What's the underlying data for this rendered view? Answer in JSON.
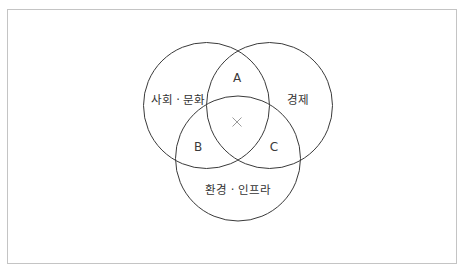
{
  "diagram": {
    "type": "venn",
    "style": {
      "frame_border_color": "#c4c4c4",
      "circle_stroke_color": "#3a3a3a",
      "text_color": "#333333",
      "center_mark_color": "#9a9a9a"
    },
    "sets": [
      {
        "id": "social",
        "label": "사회 · 문화"
      },
      {
        "id": "economy",
        "label": "경제"
      },
      {
        "id": "environment",
        "label": "환경 · 인프라"
      }
    ],
    "regions": [
      {
        "id": "A",
        "label": "A",
        "between": [
          "사회 · 문화",
          "경제"
        ]
      },
      {
        "id": "B",
        "label": "B",
        "between": [
          "사회 · 문화",
          "환경 · 인프라"
        ]
      },
      {
        "id": "C",
        "label": "C",
        "between": [
          "경제",
          "환경 · 인프라"
        ]
      }
    ],
    "center": {
      "mark": "×",
      "icon": "x-mark-icon"
    }
  }
}
